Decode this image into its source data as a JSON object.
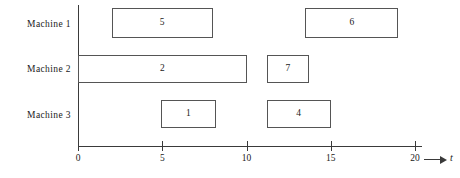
{
  "chart_data": {
    "type": "bar",
    "title": "",
    "xlabel": "t",
    "ylabel": "",
    "xlim": [
      0,
      20
    ],
    "grid": false,
    "legend": "none",
    "orientation": "horizontal",
    "categories": [
      "Machine 1",
      "Machine 2",
      "Machine 3"
    ],
    "x_ticks": [
      0,
      5,
      10,
      15,
      20
    ],
    "x_tick_labels": [
      "0",
      "5",
      "10",
      "15",
      "20"
    ],
    "axis_arrow_label": "t",
    "tasks": [
      {
        "row": 0,
        "machine": "Machine 1",
        "label": "5",
        "start": 2,
        "end": 8
      },
      {
        "row": 0,
        "machine": "Machine 1",
        "label": "6",
        "start": 13.5,
        "end": 19
      },
      {
        "row": 1,
        "machine": "Machine 2",
        "label": "2",
        "start": 0,
        "end": 10
      },
      {
        "row": 1,
        "machine": "Machine 2",
        "label": "7",
        "start": 11.2,
        "end": 13.7
      },
      {
        "row": 2,
        "machine": "Machine 3",
        "label": "1",
        "start": 4.9,
        "end": 8.2
      },
      {
        "row": 2,
        "machine": "Machine 3",
        "label": "4",
        "start": 11.2,
        "end": 15
      }
    ]
  },
  "rows": [
    {
      "label": "Machine 1"
    },
    {
      "label": "Machine 2"
    },
    {
      "label": "Machine 3"
    }
  ]
}
